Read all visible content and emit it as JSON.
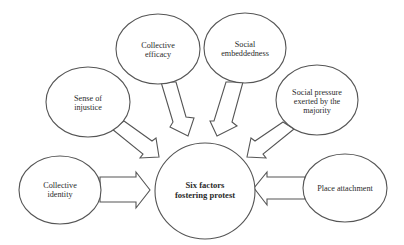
{
  "diagram": {
    "type": "hub-and-spoke",
    "center": {
      "lines": [
        "Six factors",
        "fostering protest"
      ]
    },
    "factors": [
      {
        "id": "collective-efficacy",
        "lines": [
          "Collective",
          "efficacy"
        ]
      },
      {
        "id": "social-embeddedness",
        "lines": [
          "Social",
          "embeddedness"
        ]
      },
      {
        "id": "sense-of-injustice",
        "lines": [
          "Sense of",
          "injustice"
        ]
      },
      {
        "id": "social-pressure",
        "lines": [
          "Social pressure",
          "exerted by the",
          "majority"
        ]
      },
      {
        "id": "collective-identity",
        "lines": [
          "Collective",
          "identity"
        ]
      },
      {
        "id": "place-attachment",
        "lines": [
          "Place attachment"
        ]
      }
    ],
    "edges": [
      {
        "from": "collective-efficacy",
        "to": "center"
      },
      {
        "from": "social-embeddedness",
        "to": "center"
      },
      {
        "from": "sense-of-injustice",
        "to": "center"
      },
      {
        "from": "social-pressure",
        "to": "center"
      },
      {
        "from": "collective-identity",
        "to": "center"
      },
      {
        "from": "place-attachment",
        "to": "center"
      }
    ],
    "colors": {
      "stroke": "#555555",
      "fill": "#ffffff",
      "text": "#2b2b2b"
    }
  }
}
